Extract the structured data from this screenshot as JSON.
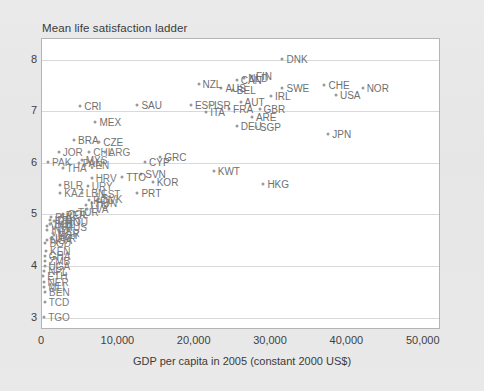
{
  "chart": {
    "title": "Mean life satisfaction ladder",
    "xlabel": "GDP per capita in 2005 (constant 2000 US$)",
    "ylabel": ""
  },
  "axis": {
    "yticks": [
      "3",
      "4",
      "5",
      "6",
      "7",
      "8"
    ],
    "xticks": [
      "0",
      "10,000",
      "20,000",
      "30,000",
      "40,000",
      "50,000"
    ]
  },
  "colors": {
    "page_background": "#e8e8e8",
    "plot_background": "#ffffff",
    "frame": "#b4b4b4",
    "gridline": "#d9d9d9",
    "marker": "#9a9a9a",
    "label_text": "#6f6f6f",
    "axis_text": "#3f3f3f"
  },
  "chart_data": {
    "type": "scatter",
    "title": "Mean life satisfaction ladder",
    "xlabel": "GDP per capita in 2005 (constant 2000 US$)",
    "ylabel": "Mean life satisfaction ladder",
    "xlim": [
      0,
      52000
    ],
    "ylim": [
      2.8,
      8.4
    ],
    "xticks": [
      0,
      10000,
      20000,
      30000,
      40000,
      50000
    ],
    "yticks": [
      3,
      4,
      5,
      6,
      7,
      8
    ],
    "grid": "horizontal",
    "legend": "none",
    "points": [
      {
        "label": "DNK",
        "x": 31500,
        "y": 8.02
      },
      {
        "label": "NOR",
        "x": 42000,
        "y": 7.45
      },
      {
        "label": "CHE",
        "x": 37000,
        "y": 7.5
      },
      {
        "label": "USA",
        "x": 38500,
        "y": 7.32
      },
      {
        "label": "SWE",
        "x": 31500,
        "y": 7.45
      },
      {
        "label": "FIN",
        "x": 27500,
        "y": 7.68
      },
      {
        "label": "NLD",
        "x": 26500,
        "y": 7.65
      },
      {
        "label": "CAN",
        "x": 25500,
        "y": 7.6
      },
      {
        "label": "BEL",
        "x": 25000,
        "y": 7.42
      },
      {
        "label": "AUS",
        "x": 23500,
        "y": 7.45
      },
      {
        "label": "IRL",
        "x": 30000,
        "y": 7.3
      },
      {
        "label": "AUT",
        "x": 26000,
        "y": 7.18
      },
      {
        "label": "GBR",
        "x": 28500,
        "y": 7.05
      },
      {
        "label": "FRA",
        "x": 24500,
        "y": 7.05
      },
      {
        "label": "DEU",
        "x": 25500,
        "y": 6.72
      },
      {
        "label": "SGP",
        "x": 28000,
        "y": 6.7
      },
      {
        "label": "ARE",
        "x": 27500,
        "y": 6.88
      },
      {
        "label": "JPN",
        "x": 37500,
        "y": 6.56
      },
      {
        "label": "NZL",
        "x": 20500,
        "y": 7.52
      },
      {
        "label": "ESP",
        "x": 19500,
        "y": 7.12
      },
      {
        "label": "ISR",
        "x": 22000,
        "y": 7.12
      },
      {
        "label": "ITA",
        "x": 21500,
        "y": 6.98
      },
      {
        "label": "SAU",
        "x": 12500,
        "y": 7.12
      },
      {
        "label": "CRI",
        "x": 5000,
        "y": 7.1
      },
      {
        "label": "MEX",
        "x": 7000,
        "y": 6.8
      },
      {
        "label": "BRA",
        "x": 4200,
        "y": 6.45
      },
      {
        "label": "CZE",
        "x": 7500,
        "y": 6.4
      },
      {
        "label": "GRC",
        "x": 15500,
        "y": 6.12
      },
      {
        "label": "CYP",
        "x": 13500,
        "y": 6.02
      },
      {
        "label": "KWT",
        "x": 22500,
        "y": 5.85
      },
      {
        "label": "HKG",
        "x": 29000,
        "y": 5.6
      },
      {
        "label": "JOR",
        "x": 2200,
        "y": 6.22
      },
      {
        "label": "CHL",
        "x": 6200,
        "y": 6.22
      },
      {
        "label": "ARG",
        "x": 8200,
        "y": 6.22
      },
      {
        "label": "MYS",
        "x": 5200,
        "y": 6.05
      },
      {
        "label": "PAK",
        "x": 800,
        "y": 6.02
      },
      {
        "label": "PAN",
        "x": 4800,
        "y": 6.0
      },
      {
        "label": "VEN",
        "x": 5600,
        "y": 5.95
      },
      {
        "label": "THA",
        "x": 2700,
        "y": 5.9
      },
      {
        "label": "SVN",
        "x": 13000,
        "y": 5.78
      },
      {
        "label": "TTO",
        "x": 10500,
        "y": 5.72
      },
      {
        "label": "HRV",
        "x": 6500,
        "y": 5.7
      },
      {
        "label": "KOR",
        "x": 14500,
        "y": 5.62
      },
      {
        "label": "BLR",
        "x": 2300,
        "y": 5.58
      },
      {
        "label": "URY",
        "x": 6000,
        "y": 5.55
      },
      {
        "label": "PRT",
        "x": 12500,
        "y": 5.42
      },
      {
        "label": "KAZ",
        "x": 2400,
        "y": 5.42
      },
      {
        "label": "LBN",
        "x": 5200,
        "y": 5.42
      },
      {
        "label": "EST",
        "x": 7200,
        "y": 5.4
      },
      {
        "label": "SVK",
        "x": 7400,
        "y": 5.3
      },
      {
        "label": "POL",
        "x": 6200,
        "y": 5.28
      },
      {
        "label": "HUN",
        "x": 6500,
        "y": 5.22
      },
      {
        "label": "LTU",
        "x": 5800,
        "y": 5.18
      },
      {
        "label": "LVA",
        "x": 5900,
        "y": 5.1
      },
      {
        "label": "TUR",
        "x": 4200,
        "y": 5.05
      },
      {
        "label": "COL",
        "x": 2800,
        "y": 5.0
      },
      {
        "label": "PER",
        "x": 2600,
        "y": 4.98
      },
      {
        "label": "PHL",
        "x": 1200,
        "y": 4.95
      },
      {
        "label": "IDN",
        "x": 1100,
        "y": 4.9
      },
      {
        "label": "CHN",
        "x": 1600,
        "y": 4.88
      },
      {
        "label": "ROU",
        "x": 2600,
        "y": 4.85
      },
      {
        "label": "BOL",
        "x": 1100,
        "y": 4.82
      },
      {
        "label": "VNM",
        "x": 600,
        "y": 4.78
      },
      {
        "label": "RUS",
        "x": 2600,
        "y": 4.75
      },
      {
        "label": "IND",
        "x": 700,
        "y": 4.7
      },
      {
        "label": "MAR",
        "x": 1500,
        "y": 4.65
      },
      {
        "label": "EGY",
        "x": 1600,
        "y": 4.6
      },
      {
        "label": "UKR",
        "x": 1200,
        "y": 4.55
      },
      {
        "label": "NGA",
        "x": 600,
        "y": 4.5
      },
      {
        "label": "BGD",
        "x": 450,
        "y": 4.45
      },
      {
        "label": "KEN",
        "x": 520,
        "y": 4.3
      },
      {
        "label": "GHA",
        "x": 350,
        "y": 4.2
      },
      {
        "label": "ZMB",
        "x": 400,
        "y": 4.1
      },
      {
        "label": "UGA",
        "x": 330,
        "y": 4.0
      },
      {
        "label": "NPL",
        "x": 280,
        "y": 3.9
      },
      {
        "label": "ETH",
        "x": 180,
        "y": 3.8
      },
      {
        "label": "NER",
        "x": 200,
        "y": 3.7
      },
      {
        "label": "MLI",
        "x": 320,
        "y": 3.6
      },
      {
        "label": "BEN",
        "x": 400,
        "y": 3.5
      },
      {
        "label": "TCD",
        "x": 350,
        "y": 3.3
      },
      {
        "label": "TGO",
        "x": 280,
        "y": 3.02
      }
    ]
  }
}
